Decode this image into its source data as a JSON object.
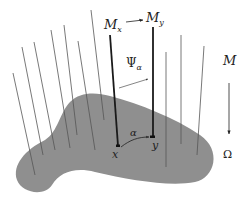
{
  "figure": {
    "type": "fiber-bundle-diagram",
    "colors": {
      "base_space": "#8f8f8f",
      "fiber": "#555555",
      "highlight_fiber": "#1a1a1a",
      "text": "#222222"
    },
    "labels": {
      "fiber_x": "M",
      "fiber_x_sub": "x",
      "fiber_y": "M",
      "fiber_y_sub": "y",
      "transport": "Ψ",
      "transport_sub": "α",
      "path": "α",
      "point_x": "x",
      "point_y": "y",
      "total_space": "M",
      "base_space": "Ω"
    },
    "fibers": [
      {
        "x1": 13,
        "y1": 73,
        "x2": 35,
        "y2": 175
      },
      {
        "x1": 22,
        "y1": 47,
        "x2": 43,
        "y2": 155
      },
      {
        "x1": 34,
        "y1": 42,
        "x2": 55,
        "y2": 150
      },
      {
        "x1": 51,
        "y1": 30,
        "x2": 70,
        "y2": 148
      },
      {
        "x1": 64,
        "y1": 25,
        "x2": 77,
        "y2": 135
      },
      {
        "x1": 78,
        "y1": 41,
        "x2": 95,
        "y2": 150
      },
      {
        "x1": 91,
        "y1": 10,
        "x2": 104,
        "y2": 120
      },
      {
        "x1": 166,
        "y1": 52,
        "x2": 166,
        "y2": 167
      },
      {
        "x1": 181,
        "y1": 35,
        "x2": 181,
        "y2": 144
      },
      {
        "x1": 204,
        "y1": 46,
        "x2": 197,
        "y2": 155
      }
    ]
  }
}
